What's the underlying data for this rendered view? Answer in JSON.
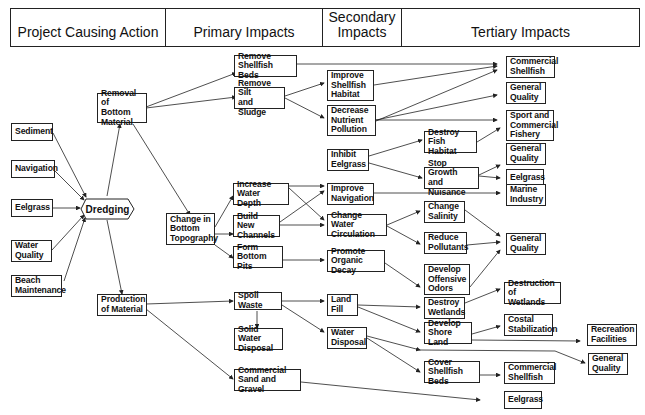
{
  "header": {
    "columns": [
      {
        "label": "Project Causing Action"
      },
      {
        "label": "Primary Impacts"
      },
      {
        "label": "Secondary\nImpacts"
      },
      {
        "label": "Tertiary Impacts"
      }
    ]
  },
  "nodes": {
    "sediment": "Sediment",
    "navigation": "Navigation",
    "eelgrass_in": "Eelgrass",
    "water_quality": "Water\nQuality",
    "beach_maintenance": "Beach\nMaintenance",
    "dredging": "Dredging",
    "removal_bottom_material": "Removal of\nBottom\nMaterial",
    "change_bottom_topography": "Change in\nBottom\nTopography",
    "production_material": "Production\nof Material",
    "remove_shellfish_beds": "Remove\nShellfish Beds",
    "remove_silt_sludge": "Remove Silt\nand Sludge",
    "increase_water_depth": "Increase\nWater Depth",
    "build_new_channels": "Build New\nChannels",
    "form_bottom_pits": "Form\nBottom Pits",
    "spoil_waste": "Spoil Waste",
    "solid_water_disposal": "Solid Water\nDisposal",
    "commercial_sand_gravel": "Commercial\nSand and Gravel",
    "improve_shellfish_habitat": "Improve\nShellfish\nHabitat",
    "decrease_nutrient_pollution": "Decrease\nNutrient\nPollution",
    "inhibit_eelgrass": "Inhibit\nEelgrass",
    "improve_navigation": "Improve\nNavigation",
    "change_water_circulation": "Change Water\nCirculation",
    "promote_organic_decay": "Promote\nOrganic Decay",
    "land_fill": "Land\nFill",
    "water_disposal": "Water\nDisposal",
    "destroy_fish_habitat": "Destroy\nFish Habitat",
    "stop_growth_nuisance": "Stop Growth\nand Nuisance",
    "change_salinity": "Change\nSalinity",
    "reduce_pollutants": "Reduce\nPollutants",
    "develop_offensive_odors": "Develop\nOffensive\nOdors",
    "destroy_wetlands": "Destroy\nWetlands",
    "develop_shore_land": "Develop\nShore Land",
    "cover_shellfish_beds": "Cover\nShellfish Beds",
    "commercial_shellfish_1": "Commercial\nShellfish",
    "general_quality_1": "General\nQuality",
    "sport_commercial_fishery": "Sport and\nCommercial\nFishery",
    "general_quality_2": "General\nQuality",
    "eelgrass_2": "Eelgrass",
    "marine_industry": "Marine\nIndustry",
    "general_quality_3": "General\nQuality",
    "destruction_wetlands": "Destruction of\nWetlands",
    "costal_stabilization": "Costal\nStabilization",
    "recreation_facilities": "Recreation\nFacilities",
    "general_quality_4": "General\nQuality",
    "commercial_shellfish_2": "Commercial\nShellfish",
    "eelgrass_3": "Eelgrass"
  },
  "colors": {
    "line": "#222222",
    "background": "#ffffff"
  }
}
